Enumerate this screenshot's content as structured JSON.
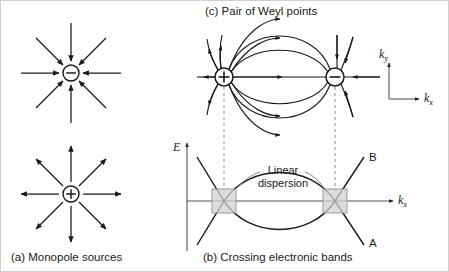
{
  "figure": {
    "type": "scientific-diagram",
    "background_color": "#ffffff",
    "line_color": "#1a1a1a",
    "dashed_line_color": "#7a8fa6",
    "crossing_box_fill": "#d2d2d2",
    "crossing_box_stroke": "#9a9a9a"
  },
  "panel_a": {
    "caption": "(a) Monopole sources",
    "monopole_sink": {
      "charge_symbol": "−",
      "name": "negative-monopole",
      "field_direction": "inward",
      "center": [
        70,
        72
      ],
      "radius": 8,
      "ray_count": 8
    },
    "monopole_source": {
      "charge_symbol": "+",
      "name": "positive-monopole",
      "field_direction": "outward",
      "center": [
        70,
        193
      ],
      "radius": 8,
      "ray_count": 8
    }
  },
  "panel_c": {
    "title": "(c) Pair of Weyl points",
    "weyl_source": {
      "charge_symbol": "+",
      "label": "positive-weyl-point",
      "center": [
        223,
        76
      ],
      "radius": 9
    },
    "weyl_sink": {
      "charge_symbol": "−",
      "label": "negative-weyl-point",
      "center": [
        334,
        76
      ],
      "radius": 9
    },
    "field_line_count": 5,
    "axes_inset": {
      "ky_label": "k",
      "ky_sub": "y",
      "kx_label": "k",
      "kx_sub": "x"
    }
  },
  "panel_b": {
    "caption": "(b) Crossing electronic bands",
    "energy_axis_label": "E",
    "momentum_axis_label": "k",
    "momentum_axis_sub": "x",
    "band_upper_label": "B",
    "band_lower_label": "A",
    "annotation_line1": "Linear",
    "annotation_line2": "dispersion",
    "crossing_points": [
      {
        "name": "weyl-crossing-left",
        "x": 223,
        "y": 200
      },
      {
        "name": "weyl-crossing-right",
        "x": 334,
        "y": 200
      }
    ],
    "crossing_box_size": 24
  },
  "connectors": {
    "dashed_vertical_count": 2,
    "description": "dashed lines linking Weyl points to band crossings"
  }
}
